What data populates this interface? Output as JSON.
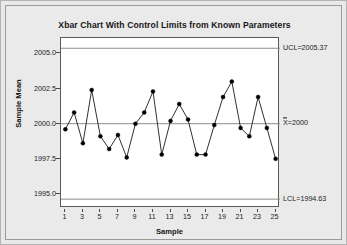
{
  "chart_data": {
    "type": "line",
    "title": "Xbar Chart With Control Limits from Known Parameters",
    "xlabel": "Sample",
    "ylabel": "Sample Mean",
    "x": [
      1,
      2,
      3,
      4,
      5,
      6,
      7,
      8,
      9,
      10,
      11,
      12,
      13,
      14,
      15,
      16,
      17,
      18,
      19,
      20,
      21,
      22,
      23,
      24,
      25
    ],
    "values": [
      1999.6,
      2000.8,
      1998.6,
      2002.4,
      1999.1,
      1998.2,
      1999.2,
      1997.6,
      2000.0,
      2000.8,
      2002.3,
      1997.8,
      2000.2,
      2001.4,
      2000.3,
      1997.8,
      1997.8,
      1999.9,
      2001.9,
      2003.0,
      1999.7,
      1999.1,
      2001.9,
      1999.7,
      1997.5
    ],
    "series": [
      {
        "name": "Sample Mean",
        "values": [
          1999.6,
          2000.8,
          1998.6,
          2002.4,
          1999.1,
          1998.2,
          1999.2,
          1997.6,
          2000.0,
          2000.8,
          2002.3,
          1997.8,
          2000.2,
          2001.4,
          2000.3,
          1997.8,
          1997.8,
          1999.9,
          2001.9,
          2003.0,
          1999.7,
          1999.1,
          2001.9,
          1999.7,
          1997.5
        ]
      }
    ],
    "ylim": [
      1994.0,
      2006.1
    ],
    "xlim": [
      0.5,
      25.5
    ],
    "yticks": [
      1995.0,
      1997.5,
      2000.0,
      2002.5,
      2005.0
    ],
    "ytick_labels": [
      "1995.0",
      "1997.5",
      "2000.0",
      "2002.5",
      "2005.0"
    ],
    "xticks": [
      1,
      3,
      5,
      7,
      9,
      11,
      13,
      15,
      17,
      19,
      21,
      23,
      25
    ],
    "xtick_labels": [
      "1",
      "3",
      "5",
      "7",
      "9",
      "11",
      "13",
      "15",
      "17",
      "19",
      "21",
      "23",
      "25"
    ],
    "grid": false,
    "legend": "none",
    "control_limits": {
      "ucl_value": 2005.37,
      "ucl_label": "UCL=2005.37",
      "center_value": 2000,
      "center_label": "X=2000",
      "center_label_prefix": "X",
      "center_label_suffix": "=2000",
      "lcl_value": 1994.63,
      "lcl_label": "LCL=1994.63"
    },
    "colors": {
      "line": "#1a1a1a",
      "marker": "#000000",
      "control_limit_line": "#8c8c8c",
      "center_line": "#8c8c8c",
      "plot_background": "#ffffff",
      "page_background": "#e9e9e9",
      "axis": "#5a5a5a"
    }
  }
}
